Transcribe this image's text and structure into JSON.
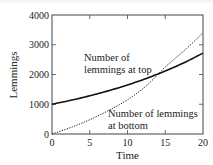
{
  "chart_data": {
    "type": "line",
    "title": "",
    "xlabel": "Time",
    "ylabel": "Lemmings",
    "xlim": [
      0,
      20
    ],
    "ylim": [
      0,
      4000
    ],
    "xticks": [
      0,
      5,
      10,
      15,
      20
    ],
    "yticks": [
      0,
      1000,
      2000,
      3000,
      4000
    ],
    "xtick_labels": [
      "0",
      "5",
      "10",
      "15",
      "20"
    ],
    "ytick_labels": [
      "0",
      "1000",
      "2000",
      "3000",
      "4000"
    ],
    "grid": false,
    "legend": null,
    "series": [
      {
        "name": "Number of lemmings at top",
        "style": "solid",
        "x": [
          0,
          2.5,
          5,
          7.5,
          10,
          12.5,
          15,
          17.5,
          20
        ],
        "values": [
          1000,
          1133,
          1284,
          1455,
          1649,
          1868,
          2117,
          2398,
          2718
        ]
      },
      {
        "name": "Number of lemmings at bottom",
        "style": "dotted",
        "x": [
          0,
          2.5,
          5,
          7.5,
          10,
          12.5,
          15,
          17.5,
          20
        ],
        "values": [
          0,
          220,
          480,
          790,
          1150,
          1620,
          2250,
          2800,
          3400
        ]
      }
    ],
    "annotations": [
      {
        "text_lines": [
          "Number of",
          "lemmings at top"
        ],
        "x": 3.8,
        "y": 2700,
        "refers_to": "Number of lemmings at top"
      },
      {
        "text_lines": [
          "Number of lemmings",
          "at bottom"
        ],
        "x": 8.5,
        "y": 850,
        "refers_to": "Number of lemmings at bottom"
      }
    ],
    "intersection": {
      "x": 13.8,
      "y": 2000
    }
  },
  "labels": {
    "xlabel": "Time",
    "ylabel": "Lemmings",
    "annot_top_line1": "Number of",
    "annot_top_line2": "lemmings at top",
    "annot_bottom_line1": "Number of lemmings",
    "annot_bottom_line2": "at bottom",
    "xticks": [
      "0",
      "5",
      "10",
      "15",
      "20"
    ],
    "yticks": [
      "0",
      "1000",
      "2000",
      "3000",
      "4000"
    ]
  }
}
